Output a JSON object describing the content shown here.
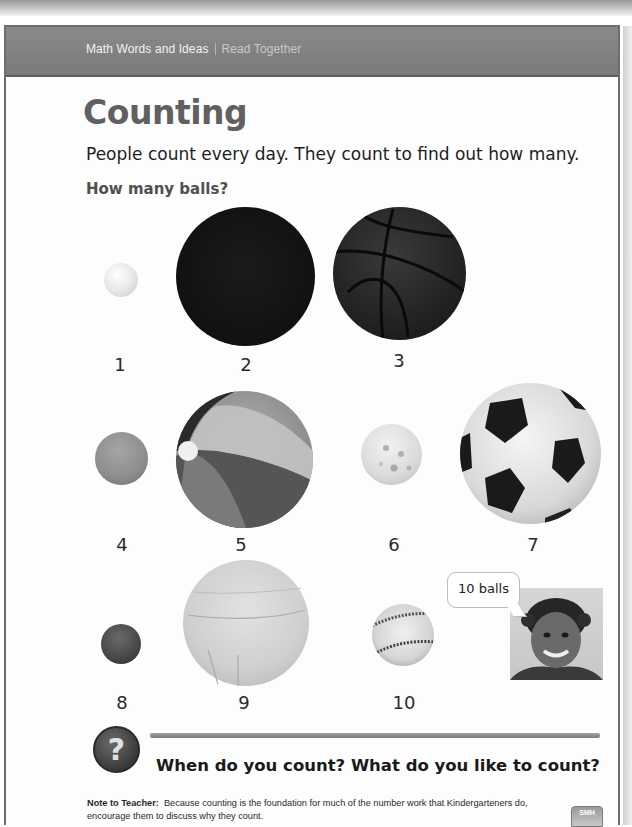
{
  "header": {
    "section": "Math Words and Ideas",
    "subsection": "Read Together"
  },
  "page": {
    "title": "Counting",
    "intro": "People count every day. They count to find out how many.",
    "question": "How many balls?"
  },
  "balls": [
    {
      "number": "1",
      "kind": "ping-pong-ball"
    },
    {
      "number": "2",
      "kind": "dark-ball"
    },
    {
      "number": "3",
      "kind": "basketball"
    },
    {
      "number": "4",
      "kind": "small-rubber-ball"
    },
    {
      "number": "5",
      "kind": "beach-ball"
    },
    {
      "number": "6",
      "kind": "wiffle-ball"
    },
    {
      "number": "7",
      "kind": "soccer-ball"
    },
    {
      "number": "8",
      "kind": "bouncy-ball"
    },
    {
      "number": "9",
      "kind": "volleyball"
    },
    {
      "number": "10",
      "kind": "baseball"
    }
  ],
  "speech_bubble": "10 balls",
  "discussion": {
    "icon": "question-mark-icon",
    "question_glyph": "?",
    "text": "When do you count? What do you like to count?"
  },
  "note": {
    "label": "Note to Teacher:",
    "text": "Because counting is the foundation for much of the number work that Kindergarteners do, encourage them to discuss why they count."
  },
  "badge": "SMH"
}
